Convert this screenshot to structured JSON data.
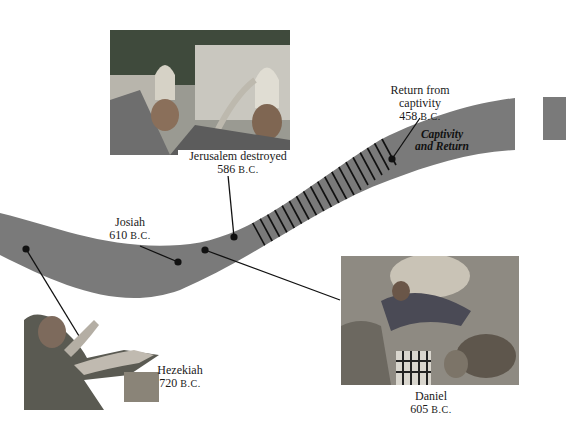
{
  "timeline": {
    "band_color": "#7a7a7a",
    "hatch_color": "#111111",
    "era_label": {
      "line1": "Captivity",
      "line2": "and Return"
    },
    "events": [
      {
        "id": "hezekiah",
        "name": "Hezekiah",
        "year": "720",
        "era": "B.C."
      },
      {
        "id": "josiah",
        "name": "Josiah",
        "year": "610",
        "era": "B.C."
      },
      {
        "id": "daniel",
        "name": "Daniel",
        "year": "605",
        "era": "B.C."
      },
      {
        "id": "jerusalem",
        "name": "Jerusalem destroyed",
        "year": "586",
        "era": "B.C."
      },
      {
        "id": "return",
        "name_line1": "Return from",
        "name_line2": "captivity",
        "year": "458",
        "era": "B.C."
      }
    ]
  },
  "illustrations": [
    {
      "id": "jerusalem-illustration",
      "subject": "soldiers with helmets and horns at city walls"
    },
    {
      "id": "daniel-illustration",
      "subject": "Daniel lowered into lions' den"
    },
    {
      "id": "hezekiah-illustration",
      "subject": "Hezekiah praying with raised arms"
    }
  ]
}
